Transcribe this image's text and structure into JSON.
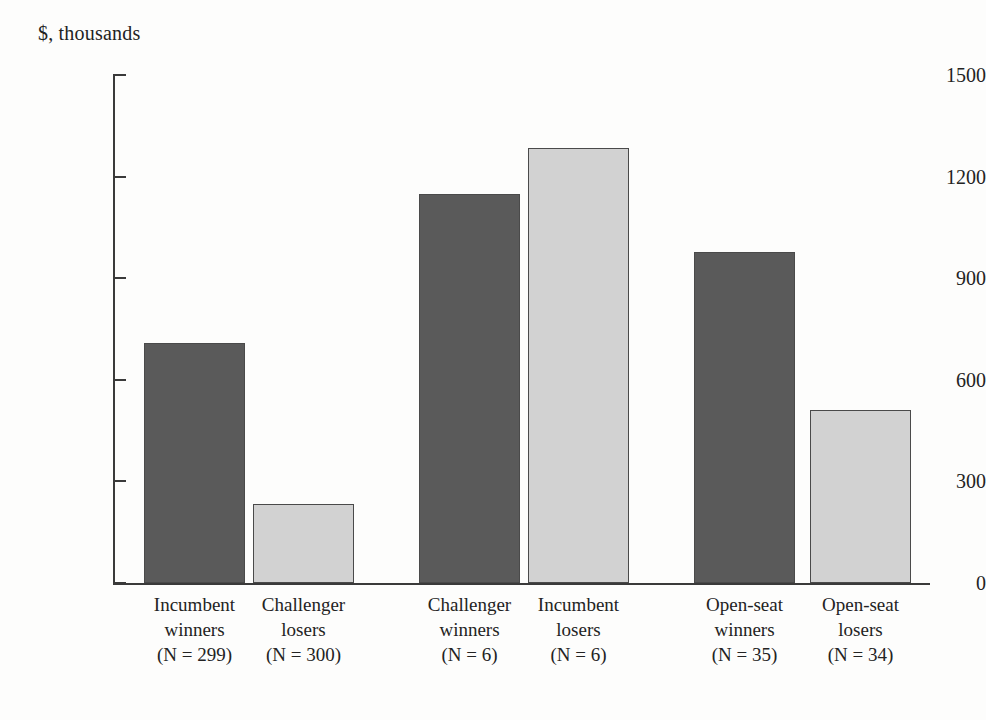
{
  "chart_data": {
    "type": "bar",
    "title": "",
    "subtitle": "",
    "xlabel": "",
    "ylabel": "$, thousands",
    "ylim": [
      0,
      1500
    ],
    "yticks": [
      0,
      300,
      600,
      900,
      1200,
      1500
    ],
    "ytick_labels": [
      "0",
      "300",
      "600",
      "900",
      "1200",
      "1500"
    ],
    "grid": false,
    "legend": false,
    "categories": [
      "Incumbent winners",
      "Challenger losers",
      "Challenger winners",
      "Incumbent losers",
      "Open-seat winners",
      "Open-seat losers"
    ],
    "values": [
      710,
      233,
      1150,
      1285,
      977,
      512
    ],
    "bars": [
      {
        "name_line1": "Incumbent",
        "name_line2": "winners",
        "count_label": "(N = 299)",
        "n": 299,
        "value": 710,
        "shade": "dark",
        "color": "#5a5a5a",
        "group": 1
      },
      {
        "name_line1": "Challenger",
        "name_line2": "losers",
        "count_label": "(N = 300)",
        "n": 300,
        "value": 233,
        "shade": "light",
        "color": "#d2d2d2",
        "group": 1
      },
      {
        "name_line1": "Challenger",
        "name_line2": "winners",
        "count_label": "(N = 6)",
        "n": 6,
        "value": 1150,
        "shade": "dark",
        "color": "#5a5a5a",
        "group": 2
      },
      {
        "name_line1": "Incumbent",
        "name_line2": "losers",
        "count_label": "(N = 6)",
        "n": 6,
        "value": 1285,
        "shade": "light",
        "color": "#d2d2d2",
        "group": 2
      },
      {
        "name_line1": "Open-seat",
        "name_line2": "winners",
        "count_label": "(N = 35)",
        "n": 35,
        "value": 977,
        "shade": "dark",
        "color": "#5a5a5a",
        "group": 3
      },
      {
        "name_line1": "Open-seat",
        "name_line2": "losers",
        "count_label": "(N = 34)",
        "n": 34,
        "value": 512,
        "shade": "light",
        "color": "#d2d2d2",
        "group": 3
      }
    ],
    "colors": {
      "dark_bar": "#5a5a5a",
      "light_bar": "#d2d2d2",
      "bar_outline": "#4a4a4a",
      "axis": "#3a3a3a",
      "text": "#232323",
      "background": "#fdfdfc"
    },
    "geometry": {
      "plot_left_px": 113,
      "plot_top_px": 75,
      "plot_bottom_px": 583,
      "plot_right_px": 930,
      "bar_width_px": 101,
      "bar_lefts_px": [
        144,
        253,
        419,
        528,
        694,
        810
      ]
    }
  }
}
